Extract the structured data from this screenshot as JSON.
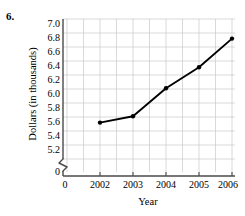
{
  "problem": {
    "number": "6."
  },
  "chart_data": {
    "type": "line",
    "title": "",
    "xlabel": "Year",
    "ylabel": "Dollars (in thousands)",
    "x": [
      2002,
      2003,
      2004,
      2005,
      2006
    ],
    "categories": [
      "2002",
      "2003",
      "2004",
      "2005",
      "2006"
    ],
    "values": [
      5.52,
      5.61,
      6.01,
      6.31,
      6.72
    ],
    "series": [
      {
        "name": "Dollars (in thousands)",
        "values": [
          5.52,
          5.61,
          6.01,
          6.31,
          6.72
        ]
      }
    ],
    "xlim": [
      2001.5,
      2006.25
    ],
    "ylim": [
      5.1,
      7.0
    ],
    "y_ticks": [
      "7.0",
      "6.8",
      "6.6",
      "6.4",
      "6.2",
      "6.0",
      "5.8",
      "5.6",
      "5.4",
      "5.2",
      "0"
    ],
    "y_tick_values": [
      7.0,
      6.8,
      6.6,
      6.4,
      6.2,
      6.0,
      5.8,
      5.6,
      5.4,
      5.2,
      0
    ],
    "x_ticks": [
      "0",
      "2002",
      "2003",
      "2004",
      "2005",
      "2006"
    ],
    "grid": true,
    "y_axis_break": true,
    "legend": "none",
    "marker": "filled-circle",
    "line_color": "#000000",
    "grid_color": "#c8c8c8",
    "axis_color": "#555555",
    "background": "#ffffff"
  }
}
